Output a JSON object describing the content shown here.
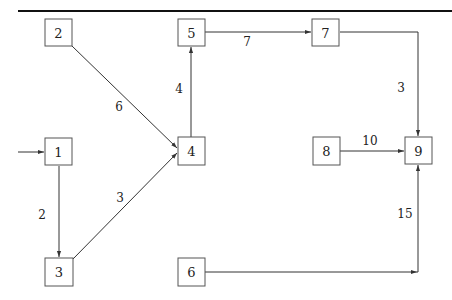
{
  "diagram": {
    "type": "network-flow-graph",
    "nodes": [
      {
        "id": "1",
        "label": "1",
        "x": 58,
        "y": 152
      },
      {
        "id": "2",
        "label": "2",
        "x": 58,
        "y": 32
      },
      {
        "id": "3",
        "label": "3",
        "x": 59,
        "y": 272
      },
      {
        "id": "4",
        "label": "4",
        "x": 191,
        "y": 151
      },
      {
        "id": "5",
        "label": "5",
        "x": 191,
        "y": 32
      },
      {
        "id": "6",
        "label": "6",
        "x": 191,
        "y": 272
      },
      {
        "id": "7",
        "label": "7",
        "x": 326,
        "y": 32
      },
      {
        "id": "8",
        "label": "8",
        "x": 326,
        "y": 151
      },
      {
        "id": "9",
        "label": "9",
        "x": 418,
        "y": 151
      }
    ],
    "edges": [
      {
        "from": "source",
        "to": "1",
        "label": ""
      },
      {
        "from": "1",
        "to": "3",
        "label": "2"
      },
      {
        "from": "2",
        "to": "4",
        "label": "6"
      },
      {
        "from": "3",
        "to": "4",
        "label": "3"
      },
      {
        "from": "4",
        "to": "5",
        "label": "4"
      },
      {
        "from": "5",
        "to": "7",
        "label": "7"
      },
      {
        "from": "7",
        "to": "9",
        "label": "3"
      },
      {
        "from": "8",
        "to": "9",
        "label": "10"
      },
      {
        "from": "6",
        "to": "9",
        "label": "15"
      }
    ]
  },
  "labels": {
    "n1": "1",
    "n2": "2",
    "n3": "3",
    "n4": "4",
    "n5": "5",
    "n6": "6",
    "n7": "7",
    "n8": "8",
    "n9": "9",
    "e1_3": "2",
    "e2_4": "6",
    "e3_4": "3",
    "e4_5": "4",
    "e5_7": "7",
    "e7_9": "3",
    "e8_9": "10",
    "e6_9": "15"
  },
  "colors": {
    "line": "#333333",
    "box_border": "#555555",
    "rule": "#111111"
  }
}
